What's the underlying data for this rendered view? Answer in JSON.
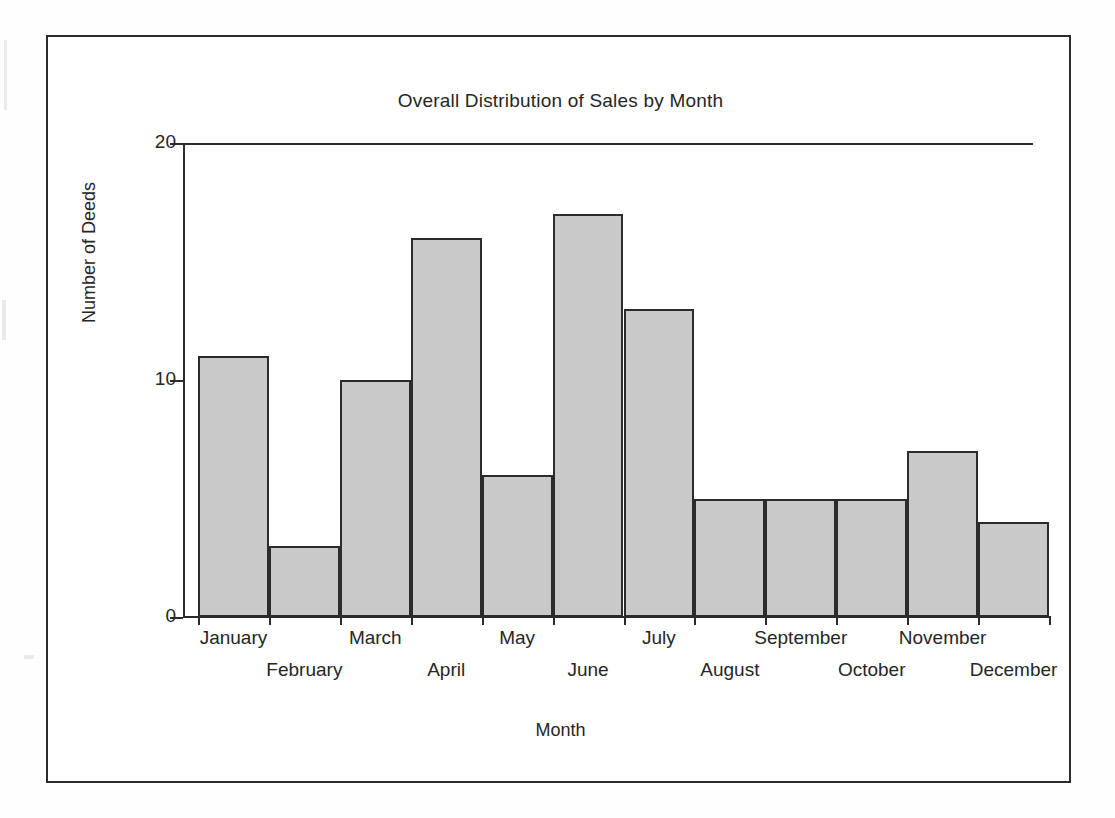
{
  "figure": {
    "title": "Overall Distribution of Sales by Month",
    "x_axis_title": "Month",
    "y_axis_title": "Number of Deeds",
    "bar_fill_color": "#c9c9c9",
    "bar_edge_color": "#2b2b2b",
    "frame_color": "#2b2b2b"
  },
  "chart_data": {
    "type": "bar",
    "title": "Overall Distribution of Sales by Month",
    "xlabel": "Month",
    "ylabel": "Number of Deeds",
    "categories": [
      "January",
      "February",
      "March",
      "April",
      "May",
      "June",
      "July",
      "August",
      "September",
      "October",
      "November",
      "December"
    ],
    "values": [
      11,
      3,
      10,
      16,
      6,
      17,
      13,
      5,
      5,
      5,
      7,
      4
    ],
    "ylim": [
      0,
      20
    ],
    "ytick_labels": [
      "0",
      "10",
      "20"
    ],
    "ytick_values": [
      0,
      10,
      20
    ],
    "grid": false,
    "legend": null,
    "bar_gap": 0
  }
}
